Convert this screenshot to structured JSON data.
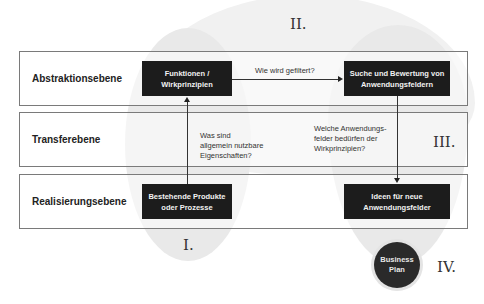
{
  "phases": {
    "I": "I.",
    "II": "II.",
    "III": "III.",
    "IV": "IV."
  },
  "levels": [
    {
      "label": "Abstraktionsebene"
    },
    {
      "label": "Transferebene"
    },
    {
      "label": "Realisierungsebene"
    }
  ],
  "boxes": {
    "functions": {
      "line1": "Funktionen /",
      "line2": "Wirkprinzipien"
    },
    "search": {
      "line1": "Suche und Bewertung von",
      "line2": "Anwendungsfeldern"
    },
    "existing": {
      "line1": "Bestehende Produkte",
      "line2": "oder Prozesse"
    },
    "ideas": {
      "line1": "Ideen für neue",
      "line2": "Anwendungsfelder"
    }
  },
  "questions": {
    "filter": "Wie wird gefiltert?",
    "properties": {
      "line1": "Was sind",
      "line2": "allgemein nutzbare",
      "line3": "Eigenschaften?"
    },
    "fields": {
      "line1": "Welche Anwendungs-",
      "line2": "felder bedürfen der",
      "line3": "Wirkprinzipien?"
    }
  },
  "business_plan": {
    "line1": "Business",
    "line2": "Plan"
  },
  "colors": {
    "box_fill": "#1c1c1c",
    "box_text": "#f2f2f2",
    "blob": "#ededed",
    "border": "#7a7a7a"
  }
}
